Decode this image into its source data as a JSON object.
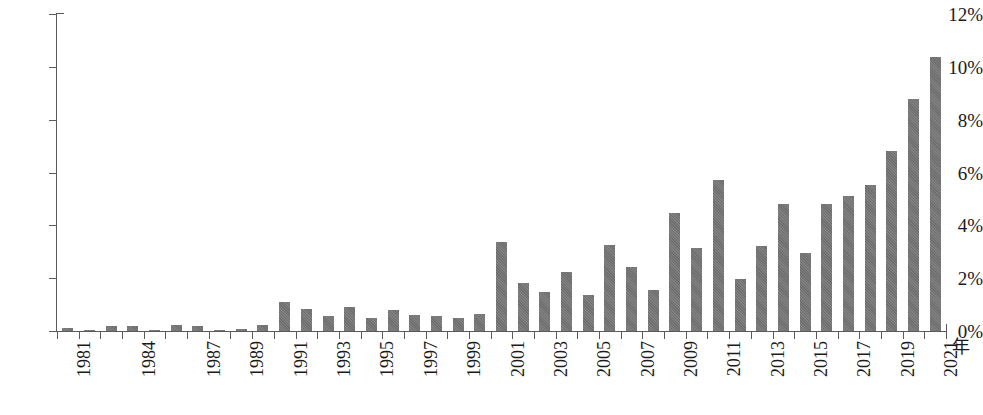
{
  "chart_data": {
    "type": "bar",
    "title": "",
    "xlabel": "年",
    "ylabel": "",
    "ylim": [
      0,
      12
    ],
    "ytick_labels": [
      "0%",
      "2%",
      "4%",
      "6%",
      "8%",
      "10%",
      "12%"
    ],
    "ytick_values": [
      0,
      2,
      4,
      6,
      8,
      10,
      12
    ],
    "grid": false,
    "legend": null,
    "bar_color": "#6e6e6e",
    "axis_color": "#5a5a5a",
    "text_color": "#1a1a1a",
    "categories": [
      "1981",
      "1982",
      "1983",
      "1984",
      "1985",
      "1986",
      "1987",
      "1988",
      "1989",
      "1990",
      "1991",
      "1992",
      "1993",
      "1994",
      "1995",
      "1996",
      "1997",
      "1998",
      "1999",
      "2000",
      "2001",
      "2002",
      "2003",
      "2004",
      "2005",
      "2006",
      "2007",
      "2008",
      "2009",
      "2010",
      "2011",
      "2012",
      "2013",
      "2014",
      "2015",
      "2016",
      "2017",
      "2018",
      "2019",
      "2020",
      "2021"
    ],
    "xtick_labels_shown": [
      "1981",
      "1984",
      "1987",
      "1989",
      "1991",
      "1993",
      "1995",
      "1997",
      "1999",
      "2001",
      "2003",
      "2005",
      "2007",
      "2009",
      "2011",
      "2013",
      "2015",
      "2017",
      "2019",
      "2021"
    ],
    "values": [
      0.12,
      0.05,
      0.18,
      0.2,
      0.05,
      0.22,
      0.18,
      0.05,
      0.08,
      0.22,
      1.1,
      0.82,
      0.55,
      0.92,
      0.5,
      0.8,
      0.62,
      0.55,
      0.5,
      0.63,
      3.38,
      1.8,
      1.48,
      2.25,
      1.36,
      3.25,
      2.42,
      1.55,
      4.48,
      3.16,
      5.72,
      1.98,
      3.22,
      4.82,
      2.96,
      4.82,
      5.1,
      5.54,
      6.82,
      8.78,
      10.38
    ],
    "last_value": 7.35,
    "caption": ""
  }
}
